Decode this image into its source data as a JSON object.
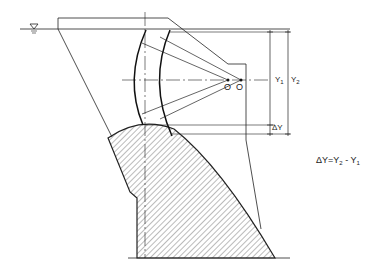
{
  "diagram": {
    "type": "radial gate on spillway crest (cross-section)",
    "labels": {
      "pivot_1": "O",
      "pivot_2": "O",
      "dim_y1": "Y",
      "dim_y1_sub": "1",
      "dim_y2": "Y",
      "dim_y2_sub": "2",
      "dim_delta": "ΔY",
      "formula_prefix": "ΔY=Y",
      "formula_sub_a": "2",
      "formula_mid": " - Y",
      "formula_sub_b": "1"
    },
    "symbols": {
      "water_level": "water-level-triangle"
    },
    "colors": {
      "line": "#222222",
      "background": "#ffffff"
    }
  }
}
